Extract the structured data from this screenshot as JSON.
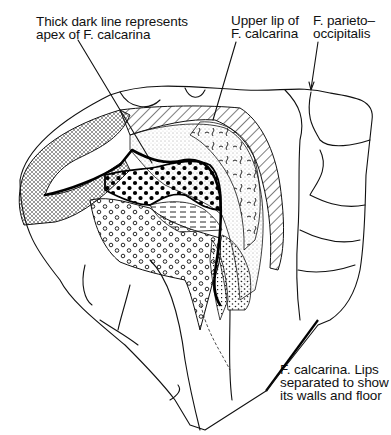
{
  "figure": {
    "labels": {
      "apex": "Thick dark line represents\napex of F. calcarina",
      "upper_lip": "Upper lip of\nF. calcarina",
      "parieto_occipitalis": "F. parieto–\noccipitalis",
      "calcarina_lips": "F. calcarina. Lips\nseparated to show\nits walls and floor"
    },
    "colors": {
      "ink": "#111111",
      "background": "#ffffff"
    }
  }
}
